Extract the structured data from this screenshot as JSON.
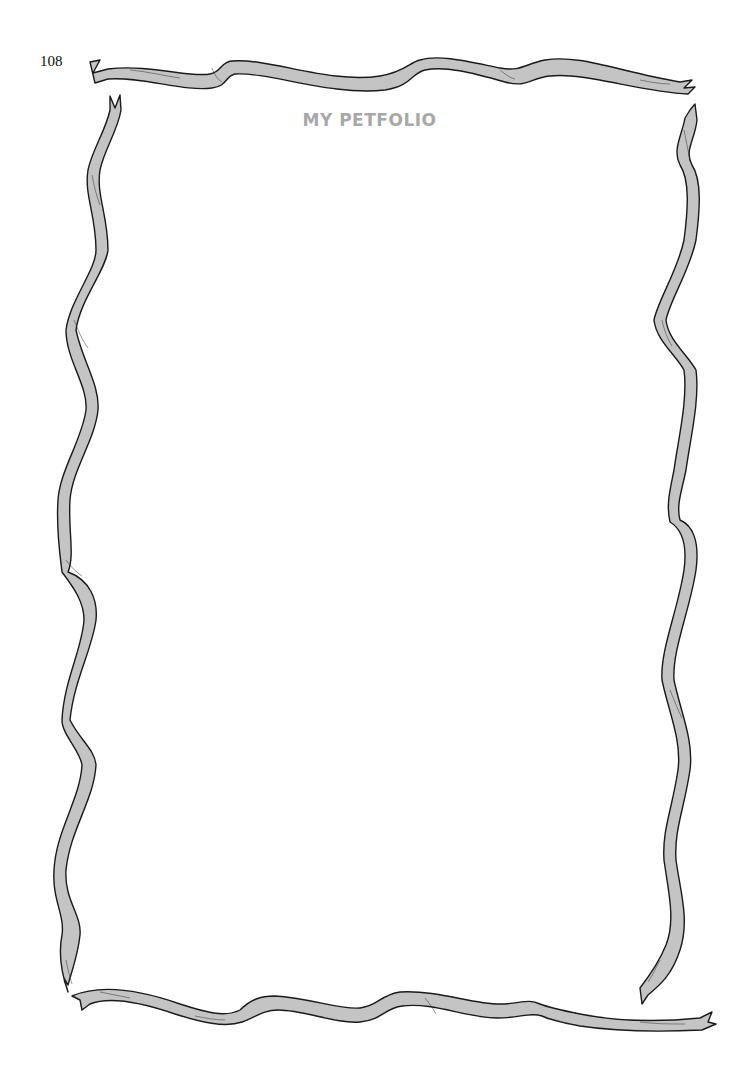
{
  "page": {
    "page_number": "108",
    "title": "MY PETFOLIO"
  },
  "frame": {
    "style": "wavy ribbon border",
    "ribbon_fill": "#c4c4c4",
    "outline_color": "#1a1a1a",
    "title_color": "#a8a8a8"
  }
}
